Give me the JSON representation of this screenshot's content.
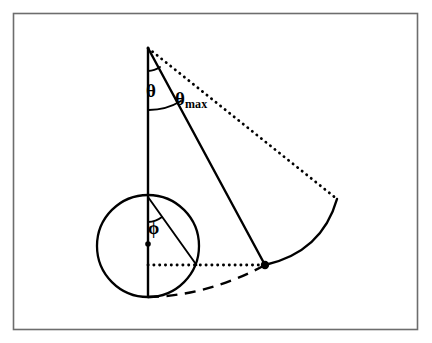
{
  "figure": {
    "background_color": "#ffffff",
    "stroke_color": "#000000",
    "frame_color": "#6d6d6d",
    "width": 432,
    "height": 343
  },
  "labels": {
    "theta": "θ",
    "theta_max_base": "θ",
    "theta_max_sub": "max",
    "phi": "ϕ"
  },
  "geometry": {
    "apex": {
      "x": 148,
      "y": 48
    },
    "vertical_line": {
      "x": 148,
      "y_top": 48,
      "y_bottom": 297
    },
    "slant_line": {
      "x1": 148,
      "y1": 48,
      "x2": 265,
      "y2": 265
    },
    "dotted_sight_line": {
      "x1": 148,
      "y1": 48,
      "x2": 337,
      "y2": 199
    },
    "trajectory_arc": {
      "start_x": 265,
      "start_y": 265,
      "end_x": 337,
      "end_y": 199,
      "bulge": "right"
    },
    "dashed_curve": {
      "start_x": 148,
      "start_y": 297,
      "end_x": 265,
      "end_y": 265,
      "bulge": "down"
    },
    "dotted_horizontal": {
      "x1": 148,
      "y1": 265,
      "x2": 265,
      "y2": 265
    },
    "circle": {
      "cx": 148,
      "cy": 246,
      "r": 51
    },
    "circle_center_dot": {
      "x": 148,
      "y": 244
    },
    "phi_chord": {
      "x1": 148,
      "y1": 197,
      "x2": 196,
      "y2": 265
    },
    "node_point": {
      "x": 265,
      "y": 265
    },
    "theta_arc_small": {
      "radius": 22,
      "at": "apex"
    },
    "theta_arc_large": {
      "radius": 62,
      "at": "apex"
    },
    "phi_arc": {
      "radius": 25,
      "at": "circle-top"
    }
  }
}
